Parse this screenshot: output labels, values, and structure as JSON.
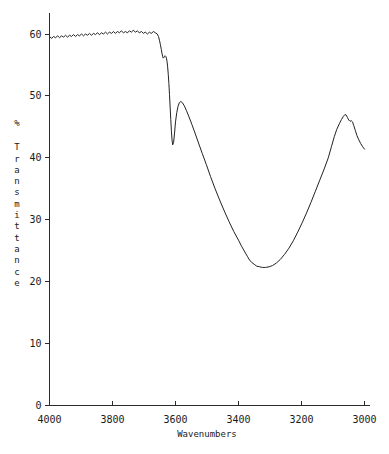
{
  "chart_data": {
    "type": "line",
    "title": "",
    "xlabel": "Wavenumbers",
    "ylabel": "% Transmittance",
    "ylabel_chars": [
      "%",
      "",
      "T",
      "r",
      "a",
      "n",
      "s",
      "m",
      "i",
      "t",
      "t",
      "a",
      "n",
      "c",
      "e"
    ],
    "xlim": [
      4000,
      3000
    ],
    "ylim": [
      0,
      62
    ],
    "x_reversed": true,
    "grid": false,
    "legend": null,
    "xticks": [
      4000,
      3800,
      3600,
      3400,
      3200,
      3000
    ],
    "xtick_labels": [
      "4000",
      "3800",
      "3600",
      "3400",
      "3200",
      "3000"
    ],
    "yticks": [
      0,
      10,
      20,
      30,
      40,
      50,
      60
    ],
    "ytick_labels": [
      "0",
      "10",
      "20",
      "30",
      "40",
      "50",
      "60"
    ],
    "series": [
      {
        "name": "transmittance",
        "color": "#222222",
        "x": [
          4000,
          3993,
          3987,
          3981,
          3974,
          3968,
          3962,
          3955,
          3949,
          3943,
          3936,
          3930,
          3924,
          3917,
          3911,
          3905,
          3898,
          3892,
          3886,
          3879,
          3873,
          3867,
          3860,
          3854,
          3848,
          3841,
          3835,
          3829,
          3822,
          3816,
          3810,
          3803,
          3797,
          3791,
          3784,
          3778,
          3772,
          3765,
          3759,
          3753,
          3746,
          3740,
          3734,
          3727,
          3721,
          3715,
          3708,
          3702,
          3696,
          3689,
          3683,
          3677,
          3670,
          3664,
          3658,
          3654,
          3651,
          3648,
          3645,
          3643,
          3641,
          3639,
          3637,
          3635,
          3633,
          3631,
          3629,
          3627,
          3625,
          3623,
          3621,
          3619,
          3617,
          3615,
          3613,
          3611,
          3609,
          3606,
          3603,
          3600,
          3596,
          3592,
          3588,
          3583,
          3578,
          3572,
          3565,
          3557,
          3548,
          3538,
          3527,
          3515,
          3502,
          3489,
          3475,
          3460,
          3445,
          3430,
          3415,
          3400,
          3390,
          3380,
          3372,
          3365,
          3358,
          3350,
          3342,
          3333,
          3324,
          3314,
          3303,
          3292,
          3280,
          3267,
          3254,
          3240,
          3226,
          3212,
          3198,
          3184,
          3170,
          3156,
          3142,
          3128,
          3115,
          3105,
          3096,
          3088,
          3080,
          3073,
          3067,
          3062,
          3058,
          3054,
          3050,
          3046,
          3042,
          3038,
          3034,
          3029,
          3024,
          3018,
          3012,
          3006,
          3000
        ],
        "y": [
          59.6,
          59.3,
          59.6,
          59.4,
          59.7,
          59.4,
          59.7,
          59.5,
          59.8,
          59.5,
          59.8,
          59.6,
          59.9,
          59.6,
          59.9,
          59.7,
          60.0,
          59.7,
          60.0,
          59.8,
          60.1,
          59.8,
          60.1,
          59.9,
          60.2,
          59.9,
          60.2,
          60.0,
          60.3,
          60.0,
          60.3,
          60.1,
          60.4,
          60.1,
          60.4,
          60.2,
          60.5,
          60.2,
          60.4,
          60.2,
          60.5,
          60.3,
          60.6,
          60.3,
          60.5,
          60.2,
          60.4,
          60.1,
          60.3,
          60.0,
          60.3,
          60.1,
          60.4,
          60.2,
          60.0,
          59.6,
          59.0,
          58.3,
          57.5,
          56.9,
          56.4,
          56.1,
          56.2,
          56.4,
          56.5,
          56.4,
          56.1,
          55.6,
          54.7,
          53.5,
          52.0,
          50.2,
          48.2,
          46.2,
          44.3,
          42.9,
          42.1,
          42.5,
          44.0,
          45.8,
          47.3,
          48.3,
          48.9,
          49.1,
          48.9,
          48.4,
          47.6,
          46.6,
          45.4,
          44.0,
          42.4,
          40.7,
          38.9,
          37.0,
          35.1,
          33.2,
          31.4,
          29.7,
          28.1,
          26.7,
          25.7,
          24.8,
          24.1,
          23.5,
          23.1,
          22.8,
          22.5,
          22.4,
          22.3,
          22.3,
          22.4,
          22.6,
          23.0,
          23.6,
          24.4,
          25.4,
          26.6,
          28.0,
          29.5,
          31.1,
          32.8,
          34.6,
          36.4,
          38.2,
          40.0,
          41.8,
          43.4,
          44.6,
          45.5,
          46.2,
          46.7,
          47.0,
          46.9,
          46.5,
          46.1,
          45.9,
          46.0,
          45.8,
          45.2,
          44.4,
          43.6,
          42.9,
          42.3,
          41.8,
          41.4
        ]
      }
    ]
  },
  "axes": {
    "y_axis_name": "y-axis",
    "x_axis_name": "x-axis"
  }
}
